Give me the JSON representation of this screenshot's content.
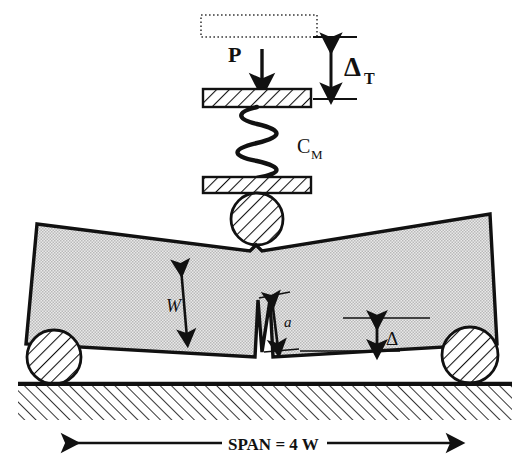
{
  "figure": {
    "type": "mechanical-schematic"
  },
  "labels": {
    "load": "P",
    "total_displacement": "Δ",
    "total_displacement_sub": "T",
    "machine_compliance": "C",
    "machine_compliance_sub": "M",
    "beam_depth": "W",
    "notch_depth": "a",
    "beam_deflection": "Δ",
    "span": "SPAN = 4 W"
  },
  "colors": {
    "outline": "#111111",
    "beam_fill": "#d2d2d2",
    "hatch": "#1a1a1a",
    "background": "#ffffff",
    "ghost_outline": "#444444"
  },
  "elements": {
    "ghost_platen": "dotted-rectangle-initial-position",
    "upper_platen": "hatched-plate",
    "lower_platen": "hatched-plate",
    "spring": "coil-spring",
    "load_roller": "hatched-circle",
    "left_support_roller": "hatched-circle",
    "right_support_roller": "hatched-circle",
    "ground": "hatched-base",
    "specimen": "notched-beam"
  },
  "geometry": {
    "span_multiplier": 4,
    "notch_shape": "V-notch",
    "beam_state": "deflected"
  }
}
